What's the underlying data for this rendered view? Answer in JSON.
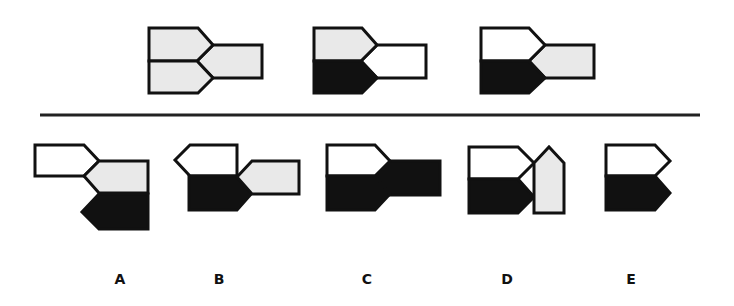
{
  "colors": {
    "light": "#e9e9e9",
    "white": "#ffffff",
    "black": "#111111",
    "stroke": "#111111",
    "separator": "#222222"
  },
  "question": {
    "figures": [
      {
        "id": "q1",
        "top": "light",
        "bottom": "light",
        "right": "light"
      },
      {
        "id": "q2",
        "top": "light",
        "bottom": "black",
        "right": "white"
      },
      {
        "id": "q3",
        "top": "white",
        "bottom": "black",
        "right": "light"
      }
    ]
  },
  "options": [
    {
      "label": "A",
      "description": "white pentagon top-left, light pentagon middle, black reversed pentagon bottom"
    },
    {
      "label": "B",
      "description": "white reversed pentagon top, black pentagon bottom, light pentagon right"
    },
    {
      "label": "C",
      "description": "white pentagon top, black pentagon bottom, black rectangle right"
    },
    {
      "label": "D",
      "description": "white pentagon top, black pentagon bottom, light vertical house shape right"
    },
    {
      "label": "E",
      "description": "white pentagon top, black pentagon bottom"
    }
  ]
}
